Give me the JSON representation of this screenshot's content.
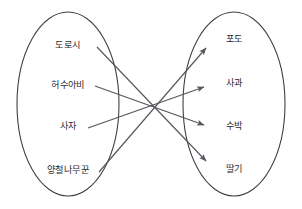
{
  "diagram": {
    "type": "mapping-diagram",
    "stroke_color": "#55555d",
    "ellipse_color": "#3f3f46",
    "text_color": "#2b2b30",
    "background": "#ffffff",
    "domain_set": {
      "name": "domain-set",
      "items": [
        {
          "id": "dorothy",
          "label": "도로시",
          "x": 68,
          "y": 46
        },
        {
          "id": "scarecrow",
          "label": "허수아비",
          "x": 68,
          "y": 86
        },
        {
          "id": "lion",
          "label": "사자",
          "x": 68,
          "y": 127
        },
        {
          "id": "tinwoodman",
          "label": "양철나무꾼",
          "x": 68,
          "y": 171
        }
      ]
    },
    "codomain_set": {
      "name": "codomain-set",
      "items": [
        {
          "id": "grape",
          "label": "포도",
          "x": 234,
          "y": 40
        },
        {
          "id": "apple",
          "label": "사과",
          "x": 234,
          "y": 84
        },
        {
          "id": "watermelon",
          "label": "수박",
          "x": 234,
          "y": 127
        },
        {
          "id": "strawberry",
          "label": "딸기",
          "x": 234,
          "y": 170
        }
      ]
    },
    "ellipses": [
      {
        "name": "domain-ellipse",
        "cx": 68,
        "cy": 104,
        "rx": 51,
        "ry": 92
      },
      {
        "name": "codomain-ellipse",
        "cx": 234,
        "cy": 104,
        "rx": 51,
        "ry": 92
      }
    ],
    "mappings": [
      {
        "from": "도로시",
        "to": "딸기",
        "x1": 97,
        "y1": 47,
        "x2": 206,
        "y2": 161
      },
      {
        "from": "허수아비",
        "to": "수박",
        "x1": 95,
        "y1": 86,
        "x2": 204,
        "y2": 125
      },
      {
        "from": "사자",
        "to": "사과",
        "x1": 88,
        "y1": 128,
        "x2": 204,
        "y2": 87
      },
      {
        "from": "양철나무꾼",
        "to": "포도",
        "x1": 99,
        "y1": 172,
        "x2": 206,
        "y2": 48
      }
    ]
  }
}
